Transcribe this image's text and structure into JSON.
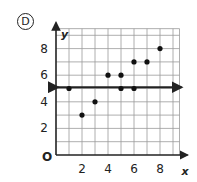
{
  "problem_label": "D",
  "chart_data": {
    "type": "scatter",
    "title": "",
    "xlabel": "x",
    "ylabel": "y",
    "origin_label": "O",
    "xlim": [
      0,
      9.5
    ],
    "ylim": [
      0,
      9.5
    ],
    "grid": true,
    "x_ticks": [
      2,
      4,
      6,
      8
    ],
    "y_ticks": [
      2,
      4,
      6,
      8
    ],
    "points": [
      {
        "x": 1,
        "y": 5
      },
      {
        "x": 2,
        "y": 3
      },
      {
        "x": 3,
        "y": 4
      },
      {
        "x": 4,
        "y": 6
      },
      {
        "x": 5,
        "y": 6
      },
      {
        "x": 5,
        "y": 5
      },
      {
        "x": 6,
        "y": 7
      },
      {
        "x": 6,
        "y": 5
      },
      {
        "x": 7,
        "y": 7
      },
      {
        "x": 8,
        "y": 8
      }
    ],
    "fit_line": {
      "type": "horizontal",
      "y": 5.1,
      "arrows": "both"
    }
  }
}
